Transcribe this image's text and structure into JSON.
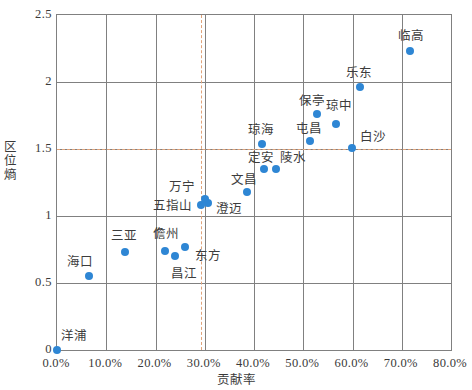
{
  "chart_data": {
    "type": "scatter",
    "title": "",
    "xlabel": "贡献率",
    "ylabel": "区位熵",
    "xlim": [
      0,
      0.8
    ],
    "ylim": [
      0,
      2.5
    ],
    "grid": true,
    "legend": "none",
    "x_ticks": [
      "0.0%",
      "10.0%",
      "20.0%",
      "30.0%",
      "40.0%",
      "50.0%",
      "60.0%",
      "70.0%",
      "80.0%"
    ],
    "x_tick_values": [
      0,
      0.1,
      0.2,
      0.3,
      0.4,
      0.5,
      0.6,
      0.7,
      0.8
    ],
    "y_ticks": [
      "0",
      "0.5",
      "1",
      "1.5",
      "2",
      "2.5"
    ],
    "y_tick_values": [
      0,
      0.5,
      1,
      1.5,
      2,
      2.5
    ],
    "point_color": "#2e86d4",
    "reference_line_color": "#e0a37a",
    "reference_lines": [
      {
        "axis": "y",
        "value": 1.5,
        "style": "dashed"
      },
      {
        "axis": "x",
        "value": 0.293,
        "style": "dashed"
      }
    ],
    "points": [
      {
        "label": "洋浦",
        "x": 0.0,
        "y": 0.0,
        "label_dx": 4,
        "label_dy": -20
      },
      {
        "label": "海口",
        "x": 0.065,
        "y": 0.55,
        "label_dx": -22,
        "label_dy": -20
      },
      {
        "label": "三亚",
        "x": 0.139,
        "y": 0.73,
        "label_dx": -14,
        "label_dy": -22
      },
      {
        "label": "儋州",
        "x": 0.22,
        "y": 0.74,
        "label_dx": -12,
        "label_dy": -23
      },
      {
        "label": "昌江",
        "x": 0.239,
        "y": 0.7,
        "label_dx": -4,
        "label_dy": 12
      },
      {
        "label": "东方",
        "x": 0.259,
        "y": 0.77,
        "label_dx": 10,
        "label_dy": 3
      },
      {
        "label": "五指山",
        "x": 0.293,
        "y": 1.08,
        "label_dx": -48,
        "label_dy": -5
      },
      {
        "label": "澄迈",
        "x": 0.307,
        "y": 1.1,
        "label_dx": 8,
        "label_dy": 0
      },
      {
        "label": "万宁",
        "x": 0.3,
        "y": 1.13,
        "label_dx": -36,
        "label_dy": -18
      },
      {
        "label": "文昌",
        "x": 0.386,
        "y": 1.18,
        "label_dx": -16,
        "label_dy": -18
      },
      {
        "label": "琼海",
        "x": 0.417,
        "y": 1.54,
        "label_dx": -14,
        "label_dy": -20
      },
      {
        "label": "定安",
        "x": 0.42,
        "y": 1.35,
        "label_dx": -16,
        "label_dy": -17
      },
      {
        "label": "陵水",
        "x": 0.444,
        "y": 1.35,
        "label_dx": 4,
        "label_dy": -17
      },
      {
        "label": "屯昌",
        "x": 0.513,
        "y": 1.56,
        "label_dx": -14,
        "label_dy": -18
      },
      {
        "label": "保亭",
        "x": 0.527,
        "y": 1.76,
        "label_dx": -18,
        "label_dy": -19
      },
      {
        "label": "琼中",
        "x": 0.567,
        "y": 1.69,
        "label_dx": -10,
        "label_dy": -24
      },
      {
        "label": "白沙",
        "x": 0.598,
        "y": 1.51,
        "label_dx": 8,
        "label_dy": -17
      },
      {
        "label": "乐东",
        "x": 0.616,
        "y": 1.96,
        "label_dx": -14,
        "label_dy": -20
      },
      {
        "label": "临高",
        "x": 0.716,
        "y": 2.23,
        "label_dx": -12,
        "label_dy": -21
      }
    ]
  }
}
